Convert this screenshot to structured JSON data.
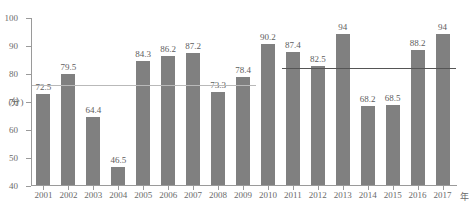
{
  "chart_data": {
    "type": "bar",
    "title": "",
    "xlabel": "年",
    "ylabel": "(分)",
    "ylim": [
      40,
      100
    ],
    "yticks": [
      40,
      50,
      60,
      70,
      80,
      90,
      100
    ],
    "grid": false,
    "legend": null,
    "categories": [
      "2001",
      "2002",
      "2003",
      "2004",
      "2005",
      "2006",
      "2007",
      "2008",
      "2009",
      "2010",
      "2011",
      "2012",
      "2013",
      "2014",
      "2015",
      "2016",
      "2017"
    ],
    "values": [
      72.5,
      79.5,
      64.4,
      46.5,
      84.3,
      86.2,
      87.2,
      73.3,
      78.4,
      90.2,
      87.4,
      82.5,
      94,
      68.2,
      68.5,
      88.2,
      94
    ],
    "value_labels": [
      "72.5",
      "79.5",
      "64.4",
      "46.5",
      "84.3",
      "86.2",
      "87.2",
      "73.3",
      "78.4",
      "90.2",
      "87.4",
      "82.5",
      "94",
      "68.2",
      "68.5",
      "88.2",
      "94"
    ],
    "bar_color": "#808080",
    "annotations": [
      {
        "name": "reference-line-early",
        "type": "hline",
        "value": 76.0,
        "x_from": "2001",
        "x_to": "2009",
        "color": "#b9b9b9"
      },
      {
        "name": "reference-line-late",
        "type": "hline",
        "value": 82.0,
        "x_from": "2011",
        "x_to": "2017",
        "color": "#555555"
      }
    ],
    "top_note": "",
    "caption": ""
  }
}
